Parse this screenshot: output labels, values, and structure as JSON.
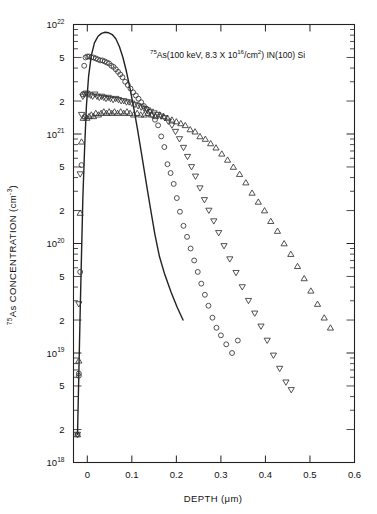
{
  "figure": {
    "name": "as-depth-profile-figure",
    "background": "#ffffff",
    "ink_color": "#222222"
  },
  "annotation": {
    "text_plain": "75As(100 keV, 8.3 X 10^16/cm^2) IN(100) Si",
    "isotope": "75",
    "species": "As",
    "paren_open": "(100 keV, 8.3 X 10",
    "fluence_exp": "16",
    "per_area": "/cm",
    "area_exp": "2",
    "paren_close": ") IN(100) Si"
  },
  "axes": {
    "x": {
      "label_main": "DEPTH (",
      "label_unit": "μm",
      "label_close": ")",
      "label_full": "DEPTH (μm)",
      "min": -0.031,
      "max": 0.6,
      "ticks": [
        {
          "value": 0,
          "label": "0"
        },
        {
          "value": 0.1,
          "label": "0.1"
        },
        {
          "value": 0.2,
          "label": "0.2"
        },
        {
          "value": 0.3,
          "label": "0.3"
        },
        {
          "value": 0.4,
          "label": "0.4"
        },
        {
          "value": 0.5,
          "label": "0.5"
        },
        {
          "value": 0.6,
          "label": "0.6"
        }
      ]
    },
    "y": {
      "label_prefix": "75",
      "label_main": "As CONCENTRATION (cm",
      "label_exp": "-3",
      "label_close": ")",
      "label_full": "75As CONCENTRATION (cm-3)",
      "scale": "log",
      "min": 1e+18,
      "max": 1e+22,
      "ticks": [
        {
          "value": 1e+22,
          "mantissa": "10",
          "exponent": "22"
        },
        {
          "value": 5e+21,
          "mantissa": "5",
          "exponent": ""
        },
        {
          "value": 2e+21,
          "mantissa": "2",
          "exponent": ""
        },
        {
          "value": 1e+21,
          "mantissa": "10",
          "exponent": "21"
        },
        {
          "value": 5e+20,
          "mantissa": "5",
          "exponent": ""
        },
        {
          "value": 2e+20,
          "mantissa": "2",
          "exponent": ""
        },
        {
          "value": 1e+20,
          "mantissa": "10",
          "exponent": "20"
        },
        {
          "value": 5e+19,
          "mantissa": "5",
          "exponent": ""
        },
        {
          "value": 2e+19,
          "mantissa": "2",
          "exponent": ""
        },
        {
          "value": 1e+19,
          "mantissa": "10",
          "exponent": "19"
        },
        {
          "value": 5e+18,
          "mantissa": "5",
          "exponent": ""
        },
        {
          "value": 2e+18,
          "mantissa": "2",
          "exponent": ""
        },
        {
          "value": 1e+18,
          "mantissa": "10",
          "exponent": "18"
        }
      ]
    }
  },
  "chart_data": {
    "type": "scatter",
    "title": "",
    "xlabel": "DEPTH (μm)",
    "ylabel": "75As CONCENTRATION (cm-3)",
    "xlim": [
      -0.031,
      0.6
    ],
    "ylim": [
      1e+18,
      1e+22
    ],
    "yscale": "log",
    "grid": false,
    "legend": "none",
    "annotations": [
      "75As(100 keV, 8.3 X 10^16/cm^2) IN(100) Si"
    ],
    "series": [
      {
        "name": "solid-curve-lss-profile",
        "marker": "line",
        "style": "solid",
        "x": [
          -0.022,
          -0.019,
          -0.016,
          -0.013,
          -0.01,
          -0.006,
          -0.002,
          0.003,
          0.009,
          0.016,
          0.024,
          0.032,
          0.04,
          0.048,
          0.056,
          0.064,
          0.072,
          0.08,
          0.088,
          0.096,
          0.104,
          0.112,
          0.12,
          0.128,
          0.136,
          0.144,
          0.152,
          0.162,
          0.174,
          0.188,
          0.202,
          0.215
        ],
        "y": [
          1.8e+18,
          6.5e+18,
          2.4e+19,
          8e+19,
          2.6e+20,
          7.5e+20,
          1.8e+21,
          3.4e+21,
          5.2e+21,
          6.8e+21,
          7.8e+21,
          8.3e+21,
          8.5e+21,
          8.4e+21,
          8.1e+21,
          7.4e+21,
          6.3e+21,
          5e+21,
          3.7e+21,
          2.6e+21,
          1.75e+21,
          1.15e+21,
          7.3e+20,
          4.6e+20,
          2.9e+20,
          1.85e+20,
          1.2e+20,
          7.6e+19,
          5.2e+19,
          3.6e+19,
          2.6e+19,
          2e+19
        ]
      },
      {
        "name": "circles-dose-1",
        "marker": "circle",
        "x": [
          -0.022,
          -0.019,
          -0.019,
          -0.016,
          -0.013,
          -0.01,
          -0.007,
          -0.004,
          0.0,
          0.004,
          0.009,
          0.014,
          0.019,
          0.024,
          0.029,
          0.034,
          0.039,
          0.044,
          0.049,
          0.054,
          0.059,
          0.064,
          0.069,
          0.074,
          0.079,
          0.085,
          0.091,
          0.097,
          0.103,
          0.109,
          0.115,
          0.121,
          0.127,
          0.133,
          0.139,
          0.145,
          0.152,
          0.159,
          0.166,
          0.173,
          0.18,
          0.187,
          0.194,
          0.201,
          0.208,
          0.216,
          0.224,
          0.232,
          0.24,
          0.248,
          0.256,
          0.264,
          0.272,
          0.281,
          0.29,
          0.3,
          0.312,
          0.325,
          0.338
        ],
        "y": [
          1.8e+18,
          6.5e+18,
          6.2e+18,
          5.5e+19,
          5.2e+20,
          2.3e+21,
          4.2e+21,
          5e+21,
          5.1e+21,
          5.1e+21,
          5e+21,
          5e+21,
          4.9e+21,
          4.8e+21,
          4.7e+21,
          4.7e+21,
          4.6e+21,
          4.5e+21,
          4.4e+21,
          4.2e+21,
          4.1e+21,
          3.9e+21,
          3.7e+21,
          3.5e+21,
          3.3e+21,
          3e+21,
          2.8e+21,
          2.6e+21,
          2.4e+21,
          2.25e+21,
          2.1e+21,
          1.95e+21,
          1.8e+21,
          1.7e+21,
          1.6e+21,
          1.5e+21,
          1.35e+21,
          1.2e+21,
          9.5e+20,
          7.6e+20,
          5.3e+20,
          4.4e+20,
          3.5e+20,
          2.6e+20,
          1.95e+20,
          1.45e+20,
          1.15e+20,
          9e+19,
          7e+19,
          5.5e+19,
          4.3e+19,
          3.4e+19,
          2.7e+19,
          2.1e+19,
          1.7e+19,
          1.45e+19,
          1.2e+19,
          1e+19,
          1.3e+19
        ]
      },
      {
        "name": "down-triangles-dose-2",
        "marker": "triangle-down",
        "x": [
          -0.022,
          -0.019,
          -0.016,
          -0.013,
          -0.01,
          -0.006,
          -0.002,
          0.002,
          0.007,
          0.012,
          0.017,
          0.022,
          0.027,
          0.032,
          0.037,
          0.042,
          0.047,
          0.052,
          0.058,
          0.064,
          0.07,
          0.076,
          0.082,
          0.088,
          0.094,
          0.1,
          0.107,
          0.114,
          0.121,
          0.128,
          0.135,
          0.142,
          0.15,
          0.158,
          0.166,
          0.174,
          0.182,
          0.19,
          0.198,
          0.207,
          0.216,
          0.225,
          0.234,
          0.243,
          0.253,
          0.263,
          0.273,
          0.284,
          0.295,
          0.307,
          0.32,
          0.334,
          0.348,
          0.362,
          0.376,
          0.39,
          0.404,
          0.418,
          0.432,
          0.446,
          0.458
        ],
        "y": [
          1.8e+18,
          2.8e+19,
          4.3e+20,
          1.5e+21,
          2.2e+21,
          2.3e+21,
          2.35e+21,
          2.3e+21,
          2.25e+21,
          2.2e+21,
          2.3e+21,
          2.2e+21,
          2.15e+21,
          2.2e+21,
          2.15e+21,
          2.1e+21,
          2.15e+21,
          2.1e+21,
          2.05e+21,
          2.1e+21,
          2.05e+21,
          2e+21,
          2e+21,
          1.95e+21,
          1.95e+21,
          1.9e+21,
          1.85e+21,
          1.8e+21,
          1.75e+21,
          1.7e+21,
          1.65e+21,
          1.6e+21,
          1.55e+21,
          1.5e+21,
          1.45e+21,
          1.4e+21,
          1.3e+21,
          1.2e+21,
          1.05e+21,
          9e+20,
          7.5e+20,
          6.2e+20,
          5e+20,
          4.1e+20,
          3.2e+20,
          2.5e+20,
          2e+20,
          1.6e+20,
          1.25e+20,
          9.5e+19,
          7.2e+19,
          5.4e+19,
          4e+19,
          3e+19,
          2.3e+19,
          1.75e+19,
          1.3e+19,
          9.5e+18,
          7.2e+18,
          5.4e+18,
          4.6e+18
        ]
      },
      {
        "name": "up-triangles-dose-3",
        "marker": "triangle-up",
        "x": [
          -0.022,
          -0.019,
          -0.016,
          -0.013,
          -0.009,
          -0.005,
          -0.001,
          0.004,
          0.009,
          0.014,
          0.019,
          0.025,
          0.031,
          0.037,
          0.043,
          0.049,
          0.055,
          0.061,
          0.068,
          0.075,
          0.082,
          0.089,
          0.096,
          0.104,
          0.112,
          0.12,
          0.128,
          0.136,
          0.144,
          0.153,
          0.162,
          0.171,
          0.18,
          0.19,
          0.2,
          0.21,
          0.22,
          0.231,
          0.242,
          0.253,
          0.265,
          0.277,
          0.289,
          0.302,
          0.315,
          0.328,
          0.342,
          0.356,
          0.37,
          0.384,
          0.398,
          0.412,
          0.427,
          0.442,
          0.457,
          0.472,
          0.487,
          0.502,
          0.517,
          0.532,
          0.546
        ],
        "y": [
          1.8e+18,
          8.5e+18,
          1.9e+20,
          8.5e+20,
          1.4e+21,
          1.45e+21,
          1.4e+21,
          1.45e+21,
          1.5e+21,
          1.45e+21,
          1.55e+21,
          1.5e+21,
          1.55e+21,
          1.6e+21,
          1.55e+21,
          1.6e+21,
          1.55e+21,
          1.6e+21,
          1.55e+21,
          1.6e+21,
          1.55e+21,
          1.6e+21,
          1.55e+21,
          1.5e+21,
          1.55e+21,
          1.5e+21,
          1.5e+21,
          1.55e+21,
          1.5e+21,
          1.45e+21,
          1.5e+21,
          1.45e+21,
          1.4e+21,
          1.35e+21,
          1.3e+21,
          1.25e+21,
          1.2e+21,
          1.1e+21,
          1.05e+21,
          9.5e+20,
          9e+20,
          8.2e+20,
          7.5e+20,
          6.6e+20,
          5.8e+20,
          5e+20,
          4.3e+20,
          3.6e+20,
          2.9e+20,
          2.4e+20,
          2e+20,
          1.6e+20,
          1.3e+20,
          1e+20,
          8e+19,
          6.2e+19,
          4.8e+19,
          3.7e+19,
          2.8e+19,
          2.1e+19,
          1.7e+19
        ]
      }
    ]
  }
}
